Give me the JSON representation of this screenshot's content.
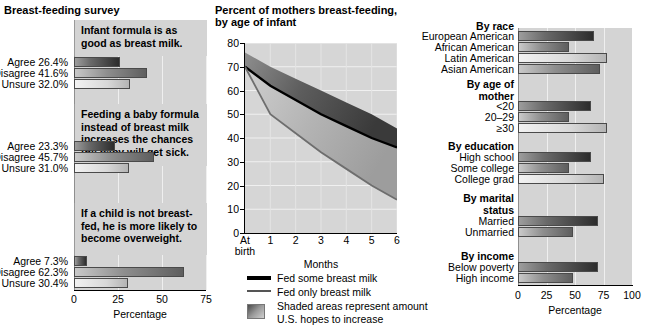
{
  "left_panel": {
    "title": "Breast-feeding survey",
    "axis": {
      "ticks": [
        "0",
        "25",
        "50",
        "75"
      ],
      "max": 75,
      "caption": "Percentage"
    },
    "questions": [
      {
        "statement": "Infant formula is as good as breast milk.",
        "responses": [
          {
            "label": "Agree 26.4%",
            "value": 26.4,
            "style": "dark"
          },
          {
            "label": "Disagree 41.6%",
            "value": 41.6,
            "style": "mid"
          },
          {
            "label": "Unsure 32.0%",
            "value": 32.0,
            "style": "light"
          }
        ]
      },
      {
        "statement": "Feeding a baby formula instead of breast milk increases the chances the baby will get sick.",
        "responses": [
          {
            "label": "Agree 23.3%",
            "value": 23.3,
            "style": "dark"
          },
          {
            "label": "Disagree 45.7%",
            "value": 45.7,
            "style": "mid"
          },
          {
            "label": "Unsure 31.0%",
            "value": 31.0,
            "style": "light"
          }
        ]
      },
      {
        "statement": "If a child is not breast-fed, he is more likely to become overweight.",
        "responses": [
          {
            "label": "Agree 7.3%",
            "value": 7.3,
            "style": "dark"
          },
          {
            "label": "Disagree 62.3%",
            "value": 62.3,
            "style": "mid"
          },
          {
            "label": "Unsure 30.4%",
            "value": 30.4,
            "style": "light"
          }
        ]
      }
    ]
  },
  "center_panel": {
    "title_line1": "Percent of mothers breast-feeding,",
    "title_line2": "by age of infant",
    "legend": [
      {
        "swatch": "thick-line",
        "text": "Fed some breast milk"
      },
      {
        "swatch": "thin-line",
        "text": "Fed only breast milk"
      },
      {
        "swatch": "shaded-area",
        "text": "Shaded areas represent amount",
        "text2": "U.S. hopes to increase"
      }
    ]
  },
  "right_panel": {
    "axis": {
      "ticks": [
        "0",
        "25",
        "50",
        "75",
        "100"
      ],
      "max": 100,
      "caption": "Percentage"
    },
    "groups": [
      {
        "heading": "By race",
        "heading_line2": "",
        "rows": [
          {
            "label": "European American",
            "value": 67,
            "style": "dark"
          },
          {
            "label": "African American",
            "value": 45,
            "style": "mid"
          },
          {
            "label": "Latin American",
            "value": 78,
            "style": "light"
          },
          {
            "label": "Asian American",
            "value": 72,
            "style": "mid"
          }
        ]
      },
      {
        "heading": "By age of",
        "heading_line2": "mother",
        "rows": [
          {
            "label": "<20",
            "value": 64,
            "style": "dark"
          },
          {
            "label": "20–29",
            "value": 45,
            "style": "mid"
          },
          {
            "label": "≥30",
            "value": 78,
            "style": "light"
          }
        ]
      },
      {
        "heading": "By education",
        "heading_line2": "",
        "rows": [
          {
            "label": "High school",
            "value": 64,
            "style": "dark"
          },
          {
            "label": "Some college",
            "value": 45,
            "style": "mid"
          },
          {
            "label": "College grad",
            "value": 75,
            "style": "light"
          }
        ]
      },
      {
        "heading": "By marital",
        "heading_line2": "status",
        "rows": [
          {
            "label": "Married",
            "value": 70,
            "style": "dark"
          },
          {
            "label": "Unmarried",
            "value": 48,
            "style": "mid"
          }
        ]
      },
      {
        "heading": "By income",
        "heading_line2": "",
        "rows": [
          {
            "label": "Below poverty",
            "value": 70,
            "style": "dark"
          },
          {
            "label": "High income",
            "value": 48,
            "style": "mid"
          }
        ]
      }
    ]
  },
  "chart_data": [
    {
      "type": "bar",
      "title": "Breast-feeding survey",
      "xlabel": "Percentage",
      "ylabel": "",
      "xlim": [
        0,
        75
      ],
      "orientation": "horizontal",
      "grid": true,
      "panels": [
        {
          "statement": "Infant formula is as good as breast milk.",
          "categories": [
            "Agree",
            "Disagree",
            "Unsure"
          ],
          "values": [
            26.4,
            41.6,
            32.0
          ]
        },
        {
          "statement": "Feeding a baby formula instead of breast milk increases the chances the baby will get sick.",
          "categories": [
            "Agree",
            "Disagree",
            "Unsure"
          ],
          "values": [
            23.3,
            45.7,
            31.0
          ]
        },
        {
          "statement": "If a child is not breast-fed, he is more likely to become overweight.",
          "categories": [
            "Agree",
            "Disagree",
            "Unsure"
          ],
          "values": [
            7.3,
            62.3,
            30.4
          ]
        }
      ]
    },
    {
      "type": "line",
      "title": "Percent of mothers breast-feeding, by age of infant",
      "xlabel": "Months",
      "ylabel": "",
      "x": [
        "At birth",
        "1",
        "2",
        "3",
        "4",
        "5",
        "6"
      ],
      "xlim": [
        0,
        6
      ],
      "ylim": [
        0,
        80
      ],
      "yticks": [
        0,
        10,
        20,
        30,
        40,
        50,
        60,
        70,
        80
      ],
      "grid": true,
      "legend_position": "below",
      "series": [
        {
          "name": "Fed some breast milk",
          "values": [
            70,
            62,
            56,
            50,
            45,
            40,
            36
          ]
        },
        {
          "name": "Fed only breast milk",
          "values": [
            70,
            50,
            42,
            34,
            27,
            20,
            14
          ]
        },
        {
          "name": "Shaded areas represent amount U.S. hopes to increase (upper target, fed some)",
          "values": [
            76,
            70,
            65,
            60,
            55,
            50,
            44
          ]
        },
        {
          "name": "Shaded areas represent amount U.S. hopes to increase (upper target, fed only)",
          "values": [
            70,
            56,
            50,
            44,
            38,
            31,
            25
          ]
        }
      ]
    },
    {
      "type": "bar",
      "title": "Percent breast-feeding by demographic group",
      "xlabel": "Percentage",
      "ylabel": "",
      "xlim": [
        0,
        100
      ],
      "orientation": "horizontal",
      "grid": true,
      "categories": [
        "European American",
        "African American",
        "Latin American",
        "Asian American",
        "<20",
        "20–29",
        "≥30",
        "High school",
        "Some college",
        "College grad",
        "Married",
        "Unmarried",
        "Below poverty",
        "High income"
      ],
      "values": [
        67,
        45,
        78,
        72,
        64,
        45,
        78,
        64,
        45,
        75,
        70,
        48,
        70,
        48
      ],
      "groups": [
        "By race",
        "By race",
        "By race",
        "By race",
        "By age of mother",
        "By age of mother",
        "By age of mother",
        "By education",
        "By education",
        "By education",
        "By marital status",
        "By marital status",
        "By income",
        "By income"
      ]
    }
  ]
}
